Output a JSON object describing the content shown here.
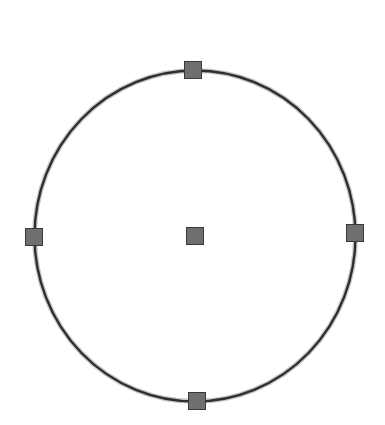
{
  "shape": {
    "type": "circle",
    "center": {
      "x": 195,
      "y": 236
    },
    "rx": 160.5,
    "ry": 165.5,
    "stroke_color": "#2e2e2e",
    "halo_color": "#9a9a9a",
    "stroke_width": 2.4
  },
  "handles": [
    {
      "name": "top-handle",
      "x": 193,
      "y": 70
    },
    {
      "name": "right-handle",
      "x": 355,
      "y": 233
    },
    {
      "name": "bottom-handle",
      "x": 197,
      "y": 401
    },
    {
      "name": "left-handle",
      "x": 34,
      "y": 237
    },
    {
      "name": "center-handle",
      "x": 195,
      "y": 236
    }
  ],
  "handle_style": {
    "size": 17,
    "fill": "#6f6f6f",
    "stroke": "#3a3a3a"
  }
}
